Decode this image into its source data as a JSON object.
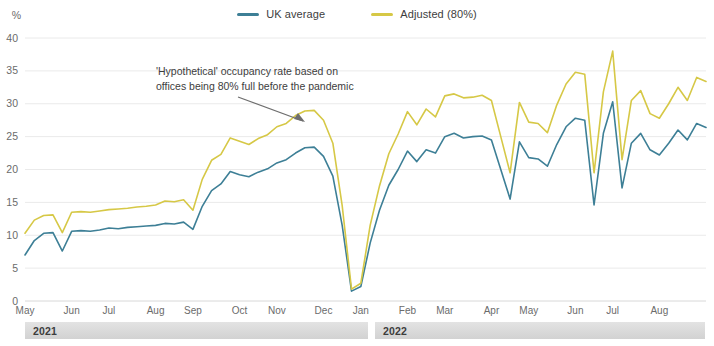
{
  "legend": {
    "position": "top-center",
    "items": [
      {
        "label": "UK average",
        "color": "#3d7f96"
      },
      {
        "label": "Adjusted (80%)",
        "color": "#d6c846"
      }
    ]
  },
  "annotation": {
    "line1": "'Hypothetical' occupancy rate based on",
    "line2": "offices being 80% full before the pandemic"
  },
  "year_bands": [
    {
      "label": "2021"
    },
    {
      "label": "2022"
    }
  ],
  "chart_data": {
    "type": "line",
    "title": "",
    "subtitle": "",
    "xlabel": "",
    "ylabel": "%",
    "ylim": [
      0,
      40
    ],
    "yticks": [
      0,
      5,
      10,
      15,
      20,
      25,
      30,
      35,
      40
    ],
    "grid": true,
    "legend_position": "top-center",
    "x_tick_labels": [
      "May",
      "Jun",
      "Jul",
      "Aug",
      "Sep",
      "Oct",
      "Nov",
      "Dec",
      "Jan",
      "Feb",
      "Mar",
      "Apr",
      "May",
      "Jun",
      "Jul",
      "Aug"
    ],
    "x_tick_indices": [
      0,
      5,
      9,
      14,
      18,
      23,
      27,
      32,
      36,
      41,
      45,
      50,
      54,
      59,
      63,
      68
    ],
    "x_range_description": "Weekly observations from May 2021 to August 2022",
    "n_points": 70,
    "series": [
      {
        "name": "UK average",
        "color": "#3d7f96",
        "values": [
          7.0,
          9.2,
          10.3,
          10.4,
          7.6,
          10.6,
          10.7,
          10.6,
          10.8,
          11.1,
          11.0,
          11.2,
          11.3,
          11.4,
          11.5,
          11.8,
          11.7,
          12.0,
          10.9,
          14.4,
          16.8,
          17.8,
          19.7,
          19.2,
          18.9,
          19.6,
          20.1,
          21.0,
          21.5,
          22.5,
          23.3,
          23.4,
          22.0,
          19.0,
          11.5,
          1.5,
          2.2,
          8.8,
          13.8,
          17.6,
          20.0,
          22.8,
          21.2,
          23.0,
          22.5,
          25.0,
          25.5,
          24.8,
          25.0,
          25.1,
          24.5,
          20.0,
          15.5,
          24.2,
          21.8,
          21.6,
          20.5,
          23.8,
          26.5,
          27.8,
          27.5,
          14.6,
          25.5,
          30.3,
          17.2,
          24.0,
          25.5,
          23.0,
          22.2,
          24.0,
          26.0,
          24.5,
          27.0,
          26.4
        ]
      },
      {
        "name": "Adjusted (80%)",
        "color": "#d6c846",
        "values": [
          10.3,
          12.3,
          13.0,
          13.1,
          10.4,
          13.5,
          13.6,
          13.5,
          13.7,
          13.9,
          14.0,
          14.1,
          14.3,
          14.4,
          14.6,
          15.2,
          15.1,
          15.4,
          13.8,
          18.5,
          21.4,
          22.3,
          24.8,
          24.3,
          23.8,
          24.7,
          25.3,
          26.5,
          27.0,
          28.2,
          28.9,
          29.0,
          27.5,
          24.0,
          14.5,
          1.8,
          2.7,
          11.5,
          17.5,
          22.4,
          25.4,
          28.8,
          26.8,
          29.2,
          28.0,
          31.2,
          31.5,
          30.9,
          31.0,
          31.3,
          30.5,
          25.0,
          19.5,
          30.2,
          27.2,
          27.0,
          25.6,
          29.8,
          33.0,
          34.8,
          34.5,
          19.5,
          31.8,
          38.0,
          21.5,
          30.5,
          32.0,
          28.5,
          27.8,
          30.0,
          32.5,
          30.5,
          34.0,
          33.4
        ]
      }
    ]
  }
}
